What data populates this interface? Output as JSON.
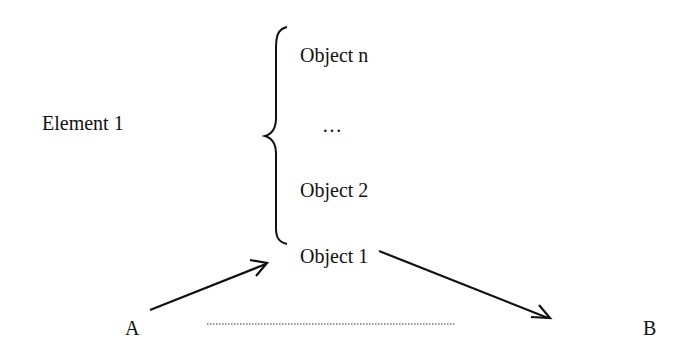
{
  "diagram": {
    "element_label": "Element 1",
    "objects": {
      "top": "Object n",
      "ellipsis": "…",
      "middle": "Object 2",
      "bottom": "Object 1"
    },
    "endpoints": {
      "start": "A",
      "end": "B"
    },
    "connections": [
      {
        "from": "A",
        "to": "Object 1",
        "style": "solid-arrow"
      },
      {
        "from": "Object 1",
        "to": "B",
        "style": "solid-arrow"
      },
      {
        "from": "A",
        "to": "B",
        "style": "dotted-line"
      }
    ],
    "colors": {
      "ink": "#111111",
      "background": "#ffffff"
    }
  }
}
